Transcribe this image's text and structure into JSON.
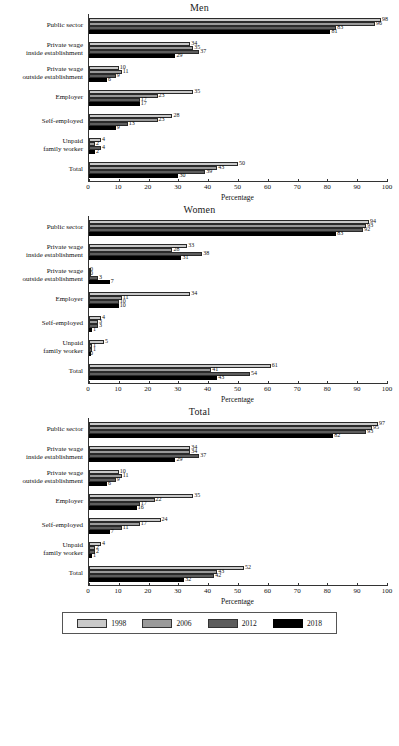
{
  "axis": {
    "xlabel": "Percentage",
    "ticks": [
      0,
      10,
      20,
      30,
      40,
      50,
      60,
      70,
      80,
      90,
      100
    ]
  },
  "legend": {
    "items": [
      {
        "label": "1998",
        "color": "#c9c9c9",
        "swatch": "legend-swatch-1998"
      },
      {
        "label": "2006",
        "color": "#9a9a9a",
        "swatch": "legend-swatch-2006"
      },
      {
        "label": "2012",
        "color": "#5d5d5d",
        "swatch": "legend-swatch-2012"
      },
      {
        "label": "2018",
        "color": "#000000",
        "swatch": "legend-swatch-2018"
      }
    ]
  },
  "categories": [
    {
      "line1": "Public sector",
      "line2": ""
    },
    {
      "line1": "Private wage",
      "line2": "inside establishment"
    },
    {
      "line1": "Private wage",
      "line2": "outside establishment"
    },
    {
      "line1": "Employer",
      "line2": ""
    },
    {
      "line1": "Self-employed",
      "line2": ""
    },
    {
      "line1": "Unpaid",
      "line2": "family worker"
    },
    {
      "line1": "Total",
      "line2": ""
    }
  ],
  "panels": [
    {
      "title": "Men"
    },
    {
      "title": "Women"
    },
    {
      "title": "Total"
    }
  ],
  "chart_data": [
    {
      "type": "bar",
      "orientation": "horizontal",
      "title": "Men",
      "xlabel": "Percentage",
      "ylabel": "",
      "xlim": [
        0,
        100
      ],
      "grid": false,
      "legend_position": "bottom-shared",
      "categories": [
        "Public sector",
        "Private wage inside establishment",
        "Private wage outside establishment",
        "Employer",
        "Self-employed",
        "Unpaid family worker",
        "Total"
      ],
      "series": [
        {
          "name": "1998",
          "values": [
            98,
            34,
            10,
            35,
            28,
            4,
            50
          ]
        },
        {
          "name": "2006",
          "values": [
            96,
            35,
            11,
            23,
            23,
            2,
            43
          ]
        },
        {
          "name": "2012",
          "values": [
            83,
            37,
            9,
            17,
            13,
            4,
            39
          ]
        },
        {
          "name": "2018",
          "values": [
            81,
            29,
            6,
            17,
            9,
            2,
            30
          ]
        }
      ]
    },
    {
      "type": "bar",
      "orientation": "horizontal",
      "title": "Women",
      "xlabel": "Percentage",
      "ylabel": "",
      "xlim": [
        0,
        100
      ],
      "grid": false,
      "legend_position": "bottom-shared",
      "categories": [
        "Public sector",
        "Private wage inside establishment",
        "Private wage outside establishment",
        "Employer",
        "Self-employed",
        "Unpaid family worker",
        "Total"
      ],
      "series": [
        {
          "name": "1998",
          "values": [
            94,
            33,
            0,
            34,
            4,
            5,
            61
          ]
        },
        {
          "name": "2006",
          "values": [
            93,
            28,
            0,
            11,
            3,
            1,
            41
          ]
        },
        {
          "name": "2012",
          "values": [
            92,
            38,
            3,
            10,
            3,
            1,
            54
          ]
        },
        {
          "name": "2018",
          "values": [
            83,
            31,
            7,
            10,
            1,
            0,
            43
          ]
        }
      ]
    },
    {
      "type": "bar",
      "orientation": "horizontal",
      "title": "Total",
      "xlabel": "Percentage",
      "ylabel": "",
      "xlim": [
        0,
        100
      ],
      "grid": false,
      "legend_position": "bottom-shared",
      "categories": [
        "Public sector",
        "Private wage inside establishment",
        "Private wage outside establishment",
        "Employer",
        "Self-employed",
        "Unpaid family worker",
        "Total"
      ],
      "series": [
        {
          "name": "1998",
          "values": [
            97,
            34,
            10,
            35,
            24,
            4,
            52
          ]
        },
        {
          "name": "2006",
          "values": [
            95,
            34,
            11,
            22,
            17,
            2,
            43
          ]
        },
        {
          "name": "2012",
          "values": [
            93,
            37,
            9,
            17,
            11,
            2,
            42
          ]
        },
        {
          "name": "2018",
          "values": [
            82,
            29,
            6,
            16,
            7,
            1,
            32
          ]
        }
      ]
    }
  ]
}
